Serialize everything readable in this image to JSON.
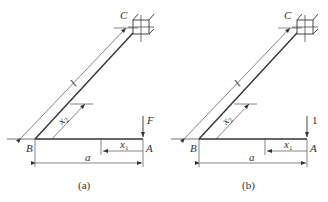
{
  "figure": {
    "panels": [
      {
        "id": "a",
        "caption": "(a)",
        "load_label": "F",
        "labels": {
          "C": "C",
          "B": "B",
          "A": "A",
          "l": "l",
          "a": "a",
          "x1": "x",
          "x1_sub": "1",
          "x2": "x",
          "x2_sub": "2"
        }
      },
      {
        "id": "b",
        "caption": "(b)",
        "load_label": "1",
        "labels": {
          "C": "C",
          "B": "B",
          "A": "A",
          "l": "l",
          "a": "a",
          "x1": "x",
          "x1_sub": "1",
          "x2": "x",
          "x2_sub": "2"
        }
      }
    ],
    "colors": {
      "line": "#333333",
      "background": "#ffffff"
    }
  }
}
